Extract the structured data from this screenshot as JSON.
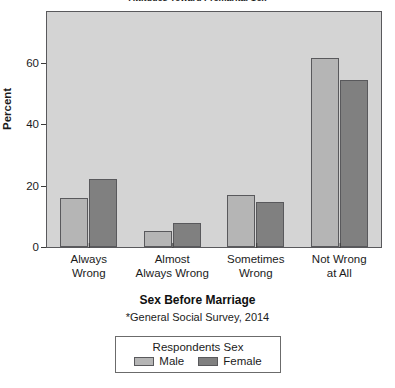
{
  "chart_data": {
    "type": "bar",
    "title": "Attitudes Toward Premarital Sex",
    "xlabel": "Sex Before Marriage",
    "ylabel": "Percent",
    "footnote": "*General Social Survey, 2014",
    "categories": [
      "Always Wrong",
      "Almost Always Wrong",
      "Sometimes Wrong",
      "Not Wrong at All"
    ],
    "category_lines": [
      [
        "Always",
        "Wrong"
      ],
      [
        "Almost",
        "Always Wrong"
      ],
      [
        "Sometimes",
        "Wrong"
      ],
      [
        "Not Wrong",
        "at All"
      ]
    ],
    "series": [
      {
        "name": "Male",
        "color": "#b5b5b5",
        "values": [
          15.8,
          5.2,
          16.8,
          61.4
        ]
      },
      {
        "name": "Female",
        "color": "#808080",
        "values": [
          22.3,
          7.7,
          14.5,
          54.5
        ]
      }
    ],
    "ylim": [
      0,
      76.5
    ],
    "yticks": [
      0,
      20,
      40,
      60
    ],
    "ytick_labels": [
      "0",
      "20",
      "40",
      "60"
    ],
    "grid": false,
    "legend_position": "bottom",
    "legend_title": "Respondents Sex",
    "panel_background": "#d4d4d4",
    "frame_color": "#59595c"
  },
  "legend": {
    "title": "Respondents Sex",
    "male_label": "Male",
    "female_label": "Female"
  }
}
